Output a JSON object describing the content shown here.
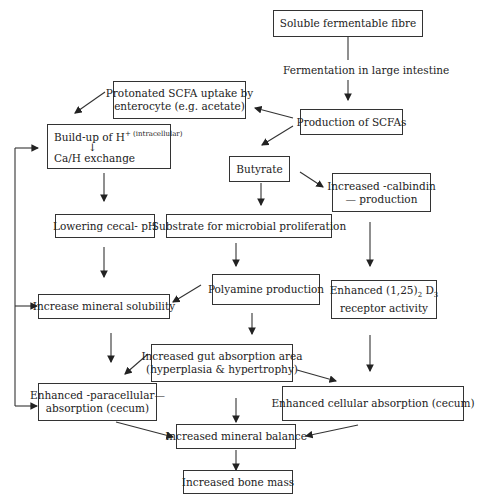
{
  "diagram": {
    "nodes": {
      "fibre": "Soluble fermentable fibre",
      "fermentation_label": "Fermentation in large intestine",
      "protonated_l1": "Protonated SCFA uptake by",
      "protonated_l2": "enterocyte (e.g. acetate)",
      "production_scfa": "Production of SCFAs",
      "buildup_l1": "Build-up of H",
      "buildup_sup": "+ (intracellular)",
      "buildup_arrow": "↓",
      "buildup_l2": "Ca/H exchange",
      "butyrate": "Butyrate",
      "calbindin_l1": "Increased -calbindin",
      "calbindin_l2": "— production",
      "lowering_ph": "Lowering cecal- pH",
      "substrate": "Substrate for microbial proliferation",
      "polyamine": "Polyamine production",
      "mineral_solubility": "Increase mineral solubility",
      "d3_l1_a": "Enhanced (1,25)",
      "d3_sub": "2",
      "d3_l1_b": " D",
      "d3_sub2": "3",
      "d3_l2": "receptor activity",
      "gut_area_l1": "Increased gut absorption area",
      "gut_area_l2": "(hyperplasia & hypertrophy)",
      "paracellular_l1": "Enhanced -paracellular—",
      "paracellular_l2": "absorption (cecum)",
      "cellular": "Enhanced cellular absorption (cecum)",
      "mineral_balance": "Increased mineral balance",
      "bone_mass": "Increased bone mass"
    },
    "edges": [
      [
        "fibre",
        "production_scfa"
      ],
      [
        "production_scfa",
        "protonated"
      ],
      [
        "production_scfa",
        "butyrate"
      ],
      [
        "protonated",
        "buildup"
      ],
      [
        "buildup",
        "lowering_ph"
      ],
      [
        "butyrate",
        "substrate"
      ],
      [
        "butyrate",
        "calbindin"
      ],
      [
        "lowering_ph",
        "mineral_solubility"
      ],
      [
        "substrate",
        "polyamine"
      ],
      [
        "calbindin",
        "d3_receptor"
      ],
      [
        "polyamine",
        "mineral_solubility"
      ],
      [
        "polyamine",
        "gut_area"
      ],
      [
        "mineral_solubility",
        "paracellular"
      ],
      [
        "gut_area",
        "paracellular"
      ],
      [
        "gut_area",
        "cellular"
      ],
      [
        "gut_area",
        "mineral_balance"
      ],
      [
        "d3_receptor",
        "cellular"
      ],
      [
        "paracellular",
        "mineral_balance"
      ],
      [
        "cellular",
        "mineral_balance"
      ],
      [
        "mineral_balance",
        "bone_mass"
      ],
      [
        "feedback_line",
        "buildup"
      ],
      [
        "feedback_line",
        "mineral_solubility"
      ],
      [
        "feedback_line",
        "paracellular"
      ]
    ]
  }
}
